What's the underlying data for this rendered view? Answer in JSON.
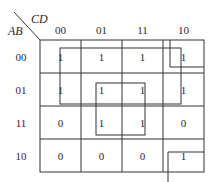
{
  "kmap": {
    "row_variable": "AB",
    "col_variable": "CD",
    "col_headers": [
      "00",
      "01",
      "11",
      "10"
    ],
    "row_headers": [
      "00",
      "01",
      "11",
      "10"
    ],
    "cells": [
      [
        "1",
        "1",
        "1",
        "1"
      ],
      [
        "1",
        "1",
        "1",
        "1"
      ],
      [
        "0",
        "1",
        "1",
        "0"
      ],
      [
        "0",
        "0",
        "0",
        "1"
      ]
    ],
    "groups": [
      {
        "name": "rows-00-01-all-columns",
        "rows": [
          "00",
          "01"
        ],
        "cols": [
          "00",
          "01",
          "11",
          "10"
        ]
      },
      {
        "name": "center-square",
        "rows": [
          "01",
          "11"
        ],
        "cols": [
          "01",
          "11"
        ]
      },
      {
        "name": "corner-wrap",
        "rows": [
          "00",
          "10"
        ],
        "cols": [
          "10"
        ]
      }
    ]
  }
}
